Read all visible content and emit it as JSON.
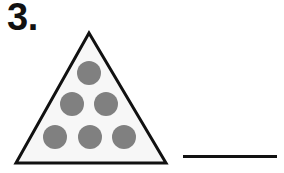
{
  "page": {
    "kind": "worksheet-problem",
    "background_color": "#ffffff",
    "width": 284,
    "height": 173
  },
  "problem": {
    "number_label": "3.",
    "answer_line": {
      "label": "",
      "color": "#111111",
      "x": 183,
      "y": 155,
      "width": 94,
      "thickness": 3
    }
  },
  "figure": {
    "name": "triangle-with-dots",
    "shape": "triangle",
    "outline_color": "#111111",
    "outline_width": 3,
    "fill_color": "#f7f7f7",
    "apex": {
      "x": 79,
      "y": 6
    },
    "bottom_left": {
      "x": 6,
      "y": 136
    },
    "bottom_right": {
      "x": 156,
      "y": 136
    },
    "dot_color": "#808080",
    "dot_diameter": 24,
    "dot_count": 6,
    "rows": [
      1,
      2,
      3
    ],
    "dots": [
      {
        "name": "dot-row1-1",
        "cx": 79,
        "cy": 46,
        "r": 12
      },
      {
        "name": "dot-row2-1",
        "cx": 62,
        "cy": 77,
        "r": 12
      },
      {
        "name": "dot-row2-2",
        "cx": 96,
        "cy": 77,
        "r": 12
      },
      {
        "name": "dot-row3-1",
        "cx": 45,
        "cy": 110,
        "r": 12
      },
      {
        "name": "dot-row3-2",
        "cx": 80,
        "cy": 110,
        "r": 12
      },
      {
        "name": "dot-row3-3",
        "cx": 114,
        "cy": 110,
        "r": 12
      }
    ]
  }
}
